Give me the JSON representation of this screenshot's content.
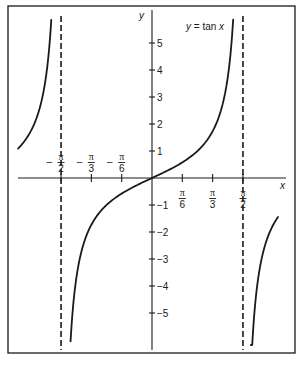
{
  "chart_data": {
    "type": "line",
    "title": "y = tan x",
    "xlabel": "x",
    "ylabel": "y",
    "xlim": [
      -2.32,
      2.28
    ],
    "ylim": [
      -6.3,
      6.0
    ],
    "grid": false,
    "legend": "none",
    "annotations": [
      {
        "text": "y = tan x",
        "position": "top-right"
      }
    ],
    "x_ticks": [
      {
        "value": -1.5708,
        "label_sign": "-",
        "num": "π",
        "den": "2"
      },
      {
        "value": -1.0472,
        "label_sign": "-",
        "num": "π",
        "den": "3"
      },
      {
        "value": -0.5236,
        "label_sign": "-",
        "num": "π",
        "den": "6"
      },
      {
        "value": 0.5236,
        "label_sign": "",
        "num": "π",
        "den": "6"
      },
      {
        "value": 1.0472,
        "label_sign": "",
        "num": "π",
        "den": "3"
      },
      {
        "value": 1.5708,
        "label_sign": "",
        "num": "π",
        "den": "2"
      }
    ],
    "y_ticks": [
      5,
      4,
      3,
      2,
      1,
      -1,
      -2,
      -3,
      -4,
      -5
    ],
    "y_tick_labels": [
      "5",
      "4",
      "3",
      "2",
      "1",
      "−1",
      "−2",
      "−3",
      "−4",
      "−5"
    ],
    "asymptotes": [
      -1.5708,
      1.5708
    ],
    "series": [
      {
        "name": "tan x (left branch)",
        "x_range": [
          -2.314,
          -1.74
        ],
        "y_range": [
          1.09,
          5.85
        ]
      },
      {
        "name": "tan x (central branch)",
        "x_range": [
          -1.407,
          1.402
        ],
        "y_range": [
          -6.04,
          5.85
        ]
      },
      {
        "name": "tan x (right branch)",
        "x_range": [
          1.708,
          2.176
        ],
        "y_range": [
          -7.2,
          -1.45
        ]
      }
    ],
    "sample_points": [
      {
        "x": -1.0472,
        "y": -1.732
      },
      {
        "x": -0.5236,
        "y": -0.577
      },
      {
        "x": 0,
        "y": 0
      },
      {
        "x": 0.5236,
        "y": 0.577
      },
      {
        "x": 1.0472,
        "y": 1.732
      }
    ]
  },
  "labels": {
    "x_axis": "x",
    "y_axis": "y",
    "function": "y = tan x"
  },
  "colors": {
    "ink": "#1a1a1a",
    "background": "#ffffff"
  }
}
